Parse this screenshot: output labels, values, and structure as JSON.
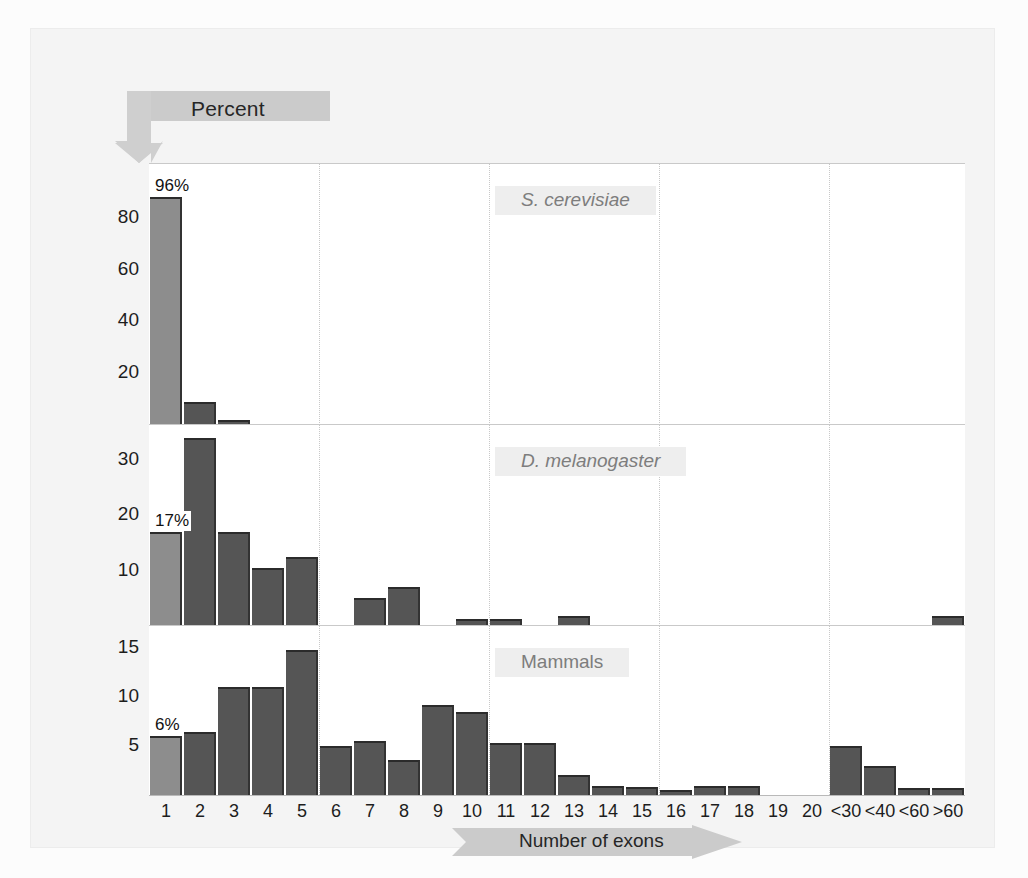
{
  "figure": {
    "y_axis_banner": "Percent",
    "x_axis_banner": "Number of exons"
  },
  "chart_data": {
    "type": "bar",
    "title": "",
    "subtitle": "",
    "xlabel": "Number of exons",
    "ylabel": "Percent",
    "grid": "vertical dotted gridlines every 5 categories",
    "legend": "none (panel titles label each series)",
    "categories": [
      "1",
      "2",
      "3",
      "4",
      "5",
      "6",
      "7",
      "8",
      "9",
      "10",
      "11",
      "12",
      "13",
      "14",
      "15",
      "16",
      "17",
      "18",
      "19",
      "20",
      "<30",
      "<40",
      "<60",
      ">60"
    ],
    "panels": [
      {
        "name": "S. cerevisiae",
        "italic": true,
        "ylim": [
          0,
          100
        ],
        "yticks": [
          20,
          40,
          60,
          80
        ],
        "annotation": "96%",
        "annotation_category": "1",
        "values": [
          96,
          9,
          2,
          0,
          0,
          0,
          0,
          0,
          0,
          0,
          0,
          0,
          0,
          0,
          0,
          0,
          0,
          0,
          0,
          0,
          0,
          0,
          0,
          0
        ],
        "drawn_values": [
          88,
          9,
          2,
          0,
          0,
          0,
          0,
          0,
          0,
          0,
          0,
          0,
          0,
          0,
          0,
          0,
          0,
          0,
          0,
          0,
          0,
          0,
          0,
          0
        ]
      },
      {
        "name": "D. melanogaster",
        "italic": true,
        "ylim": [
          0,
          36
        ],
        "yticks": [
          10,
          20,
          30
        ],
        "annotation": "17%",
        "annotation_category": "1",
        "values": [
          17,
          34,
          17,
          10.5,
          12.5,
          0,
          5,
          7,
          0,
          1.2,
          1.2,
          0,
          1.8,
          0,
          0,
          0,
          0,
          0,
          0,
          0,
          0,
          0,
          0,
          1.8
        ],
        "drawn_values": [
          17,
          34,
          17,
          10.5,
          12.5,
          0,
          5,
          7,
          0,
          1.2,
          1.2,
          0,
          1.8,
          0,
          0,
          0,
          0,
          0,
          0,
          0,
          0,
          0,
          0,
          1.8
        ]
      },
      {
        "name": "Mammals",
        "italic": false,
        "ylim": [
          0,
          17
        ],
        "yticks": [
          5,
          10,
          15
        ],
        "annotation": "6%",
        "annotation_category": "1",
        "values": [
          6,
          6.4,
          11,
          11,
          14.8,
          5,
          5.5,
          3.6,
          9.2,
          8.5,
          5.3,
          5.3,
          2,
          0.9,
          0.8,
          0.5,
          0.9,
          0.9,
          0,
          0,
          5,
          3,
          0.7,
          0.7
        ],
        "drawn_values": [
          6,
          6.4,
          11,
          11,
          14.8,
          5,
          5.5,
          3.6,
          9.2,
          8.5,
          5.3,
          5.3,
          2,
          0.9,
          0.8,
          0.5,
          0.9,
          0.9,
          0,
          0,
          5,
          3,
          0.7,
          0.7
        ]
      }
    ],
    "colors": {
      "bar": "#555555",
      "first_bar_highlight": "#8d8d8d",
      "bar_top_edge": "#2b2b2b",
      "gridline": "#c8c8c8",
      "banner": "#c9c9c9",
      "panel_title_text": "#7d7d7d",
      "panel_title_bg": "#eeeeee",
      "background": "#f4f4f4",
      "plot_background": "#ffffff"
    }
  }
}
